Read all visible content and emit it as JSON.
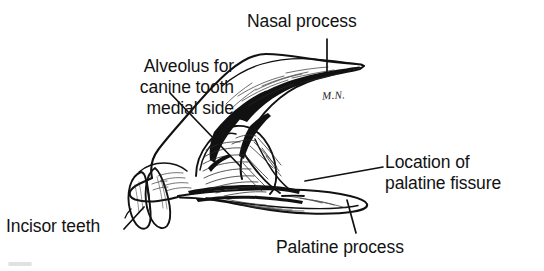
{
  "figure": {
    "kind": "anatomical-line-drawing",
    "background_color": "#ffffff",
    "ink_color": "#111111",
    "signature": "M.N.",
    "labels": [
      {
        "id": "nasal-process",
        "text": "Nasal process",
        "lines": [
          "Nasal process"
        ],
        "align": "left",
        "leader": "vertical tick from text down to the nasal process tip"
      },
      {
        "id": "alveolus",
        "text": "Alveolus for canine tooth medial side",
        "lines": [
          "Alveolus for",
          "canine tooth",
          "medial side"
        ],
        "align": "right",
        "leader": "diagonal line to the canine alveolus depression"
      },
      {
        "id": "location-palatine-fissure",
        "text": "Location of palatine fissure",
        "lines": [
          "Location of",
          "palatine fissure"
        ],
        "align": "left",
        "leader": "near-horizontal line to the palatine fissure region"
      },
      {
        "id": "palatine-process",
        "text": "Palatine process",
        "lines": [
          "Palatine process"
        ],
        "align": "left",
        "leader": "line rising to the palatine process plate"
      },
      {
        "id": "incisor-teeth",
        "text": "Incisor teeth",
        "lines": [
          "Incisor teeth"
        ],
        "align": "left",
        "leader": "short diagonal to the incisor teeth"
      }
    ]
  }
}
